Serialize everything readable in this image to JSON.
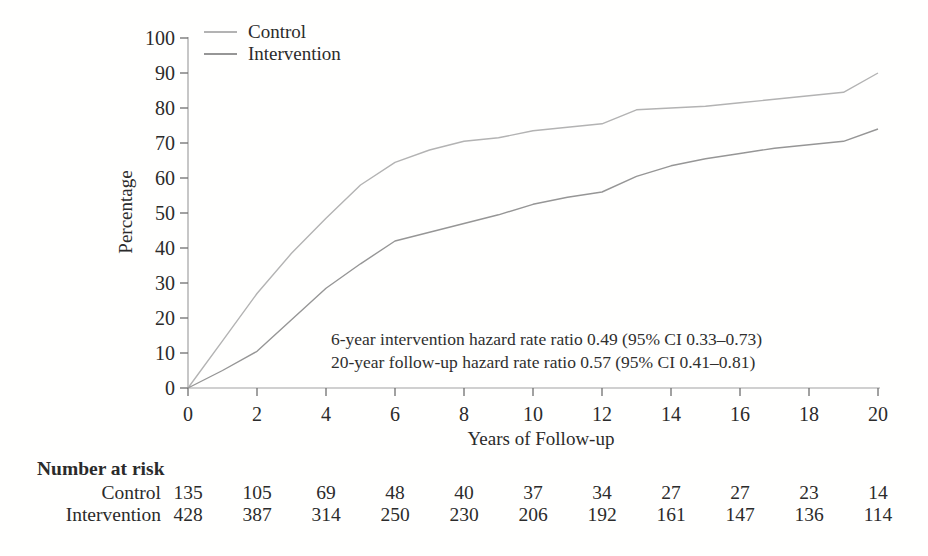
{
  "colors": {
    "control_line": "#b3b3b3",
    "intervention_line": "#969696",
    "axis": "#a2a2a2",
    "tick": "#6f6f6f",
    "text": "#2b2b2b"
  },
  "chart_data": {
    "type": "line",
    "title": "",
    "xlabel": "Years of Follow-up",
    "ylabel": "Percentage",
    "xlim": [
      0,
      20
    ],
    "ylim": [
      0,
      100
    ],
    "xticks": [
      0,
      2,
      4,
      6,
      8,
      10,
      12,
      14,
      16,
      18,
      20
    ],
    "yticks": [
      0,
      10,
      20,
      30,
      40,
      50,
      60,
      70,
      80,
      90,
      100
    ],
    "grid": false,
    "legend_position": "top-left-inside",
    "x": [
      0,
      1,
      2,
      3,
      4,
      5,
      6,
      7,
      8,
      9,
      10,
      11,
      12,
      13,
      14,
      15,
      16,
      17,
      18,
      19,
      20
    ],
    "series": [
      {
        "name": "Control",
        "color_key": "control_line",
        "values": [
          0,
          13.5,
          27,
          38.5,
          48.5,
          58,
          64.5,
          68,
          70.5,
          71.5,
          73.5,
          74.5,
          75.5,
          79.5,
          80,
          80.5,
          81.5,
          82.5,
          83.5,
          84.5,
          90
        ]
      },
      {
        "name": "Intervention",
        "color_key": "intervention_line",
        "values": [
          0,
          5,
          10.5,
          19.5,
          28.5,
          35.5,
          42,
          44.5,
          47,
          49.5,
          52.5,
          54.5,
          56,
          60.5,
          63.5,
          65.5,
          67,
          68.5,
          69.5,
          70.5,
          74
        ]
      }
    ],
    "annotations": [
      "6-year intervention hazard rate ratio 0.49 (95% CI 0.33–0.73)",
      "20-year follow-up hazard rate ratio 0.57 (95% CI 0.41–0.81)"
    ]
  },
  "risk_table": {
    "title": "Number at risk",
    "timepoints": [
      0,
      2,
      4,
      6,
      8,
      10,
      12,
      14,
      16,
      18,
      20
    ],
    "rows": [
      {
        "label": "Control",
        "values": [
          135,
          105,
          69,
          48,
          40,
          37,
          34,
          27,
          27,
          23,
          14
        ]
      },
      {
        "label": "Intervention",
        "values": [
          428,
          387,
          314,
          250,
          230,
          206,
          192,
          161,
          147,
          136,
          114
        ]
      }
    ]
  }
}
